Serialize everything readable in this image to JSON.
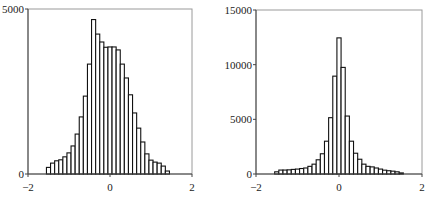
{
  "chart_data": [
    {
      "type": "bar",
      "title": "",
      "xlabel": "",
      "ylabel": "",
      "xlim": [
        -2,
        2
      ],
      "ylim": [
        0,
        5000
      ],
      "xticks": [
        "-2",
        "0",
        "2"
      ],
      "yticks": [
        "0",
        "5000"
      ],
      "grid": false,
      "bin_start": -1.55,
      "bin_width": 0.1,
      "values": [
        200,
        330,
        400,
        430,
        520,
        640,
        850,
        1210,
        1730,
        2360,
        3330,
        4680,
        4240,
        4000,
        3840,
        3850,
        3850,
        3760,
        3330,
        2910,
        2400,
        1850,
        1390,
        970,
        610,
        420,
        360,
        330,
        240,
        90
      ]
    },
    {
      "type": "bar",
      "title": "",
      "xlabel": "",
      "ylabel": "",
      "xlim": [
        -2,
        2
      ],
      "ylim": [
        0,
        15000
      ],
      "xticks": [
        "-2",
        "0",
        "2"
      ],
      "yticks": [
        "0",
        "5000",
        "10000",
        "15000"
      ],
      "grid": false,
      "bin_start": -1.55,
      "bin_width": 0.1,
      "values": [
        200,
        360,
        360,
        380,
        420,
        450,
        500,
        550,
        700,
        900,
        1300,
        1850,
        3000,
        5150,
        8950,
        12450,
        9750,
        5300,
        3000,
        1900,
        1350,
        900,
        700,
        650,
        550,
        450,
        350,
        300,
        260,
        200,
        100
      ]
    }
  ]
}
